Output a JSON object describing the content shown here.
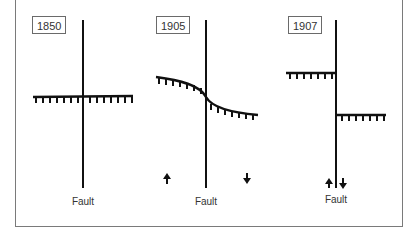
{
  "panels": [
    {
      "year": "1850",
      "fault_label": "Fault"
    },
    {
      "year": "1905",
      "fault_label": "Fault"
    },
    {
      "year": "1907",
      "fault_label": "Fault"
    }
  ],
  "arrows": {
    "panel2": {
      "left": "up-arrow",
      "right": "down-arrow"
    },
    "panel3": {
      "left": "up-arrow",
      "right": "down-arrow"
    }
  },
  "colors": {
    "line": "#111111",
    "frame": "#7a7a7a",
    "text": "#333333"
  }
}
